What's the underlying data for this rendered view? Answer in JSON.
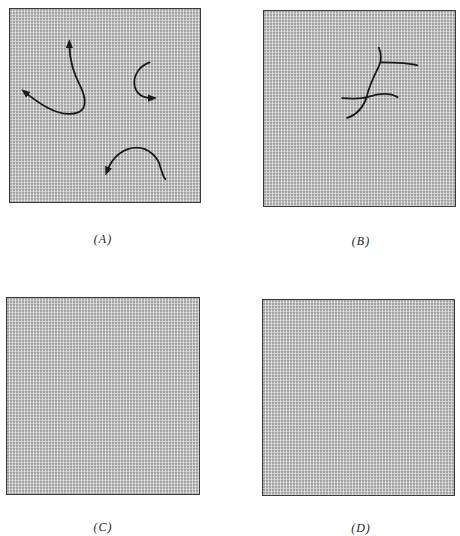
{
  "figure": {
    "panels": [
      {
        "id": "A",
        "label": "(A)",
        "content": "three curved arrows (trajectories)"
      },
      {
        "id": "B",
        "label": "(B)",
        "content": "intersecting branching curves"
      },
      {
        "id": "C",
        "label": "(C)",
        "content": "empty stippled field"
      },
      {
        "id": "D",
        "label": "(D)",
        "content": "empty stippled field"
      }
    ]
  },
  "colors": {
    "panel_fill": "#c9c9c9",
    "panel_border": "#3a3a3a",
    "stroke": "#1a1a1a",
    "background": "#ffffff"
  }
}
